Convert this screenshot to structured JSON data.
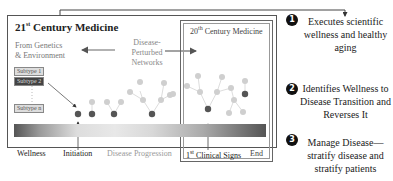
{
  "diagram": {
    "left_panel": {
      "title_main": "21",
      "title_sup": "st",
      "title_rest": " Century Medicine",
      "genetics_line1": "From Genetics",
      "genetics_line2": "& Environment",
      "subtypes": [
        "Subtype 1",
        "Subtype 2",
        "Subtype n"
      ]
    },
    "center": {
      "networks_line1": "Disease-",
      "networks_line2": "Perturbed",
      "networks_line3": "Networks"
    },
    "right_panel": {
      "title_main": "20",
      "title_sup": "th",
      "title_rest": " Century Medicine"
    },
    "timeline": {
      "wellness": "Wellness",
      "initiation": "Initiation",
      "progression": "Disease Progression",
      "clinical_main": "1",
      "clinical_sup": "st",
      "clinical_rest": " Clinical Signs",
      "end": "End"
    }
  },
  "benefits": [
    {
      "number": "1",
      "text": "Executes scientific wellness and healthy aging"
    },
    {
      "number": "2",
      "text": "Identifies Wellness to Disease Transition and Reverses It"
    },
    {
      "number": "3",
      "text": "Manage Disease—stratify disease and stratify patients"
    }
  ],
  "colors": {
    "dark_node": "#555555",
    "light_node": "#c8c8c8",
    "border": "#555555"
  }
}
